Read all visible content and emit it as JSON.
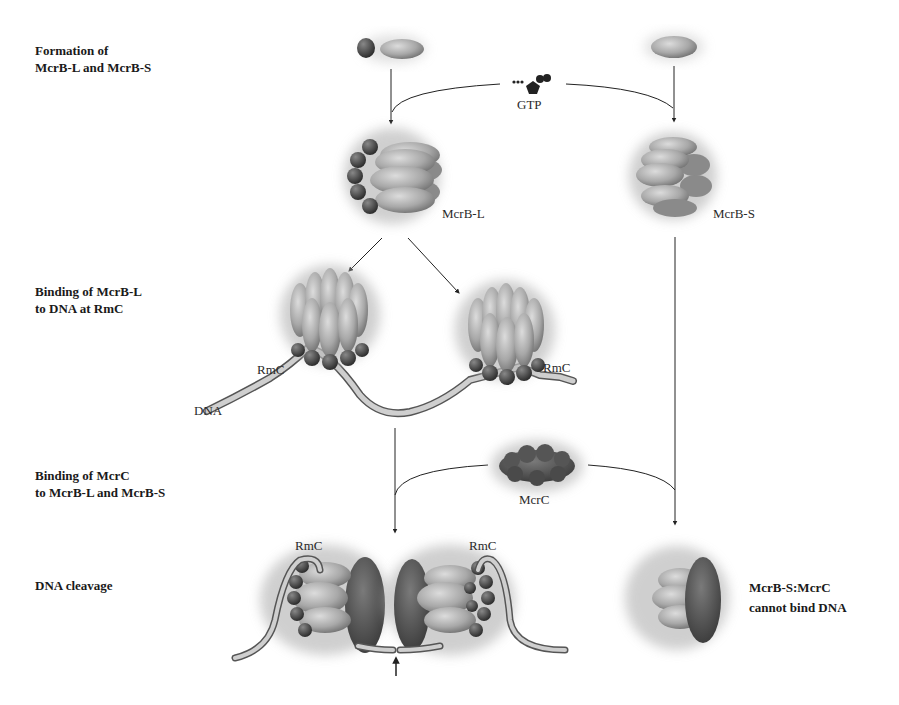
{
  "stages": [
    {
      "id": "formation",
      "label": "Formation of\nMcrB-L and McrB-S"
    },
    {
      "id": "binding-dna",
      "label": "Binding of McrB-L\nto DNA at RmC"
    },
    {
      "id": "binding-mcrc",
      "label": "Binding of McrC\nto McrB-L and McrB-S"
    },
    {
      "id": "cleavage",
      "label": "DNA cleavage"
    }
  ],
  "molecules": {
    "gtp": "GTP",
    "mcrb_l": "McrB-L",
    "mcrb_s": "McrB-S",
    "rmc_left": "RmC",
    "rmc_right": "RmC",
    "dna": "DNA",
    "mcrc": "McrC",
    "rmc_cleave_left": "RmC",
    "rmc_cleave_right": "RmC"
  },
  "notes": {
    "mcrb_s_mcrc": "McrB-S:McrC\ncannot bind DNA"
  },
  "colors": {
    "background": "#ffffff",
    "line": "#222222",
    "protein_light": "#b5b5b5",
    "protein_mid": "#8a8a8a",
    "protein_dark": "#3f3f3f",
    "dna_fill": "#c8c8c8"
  }
}
